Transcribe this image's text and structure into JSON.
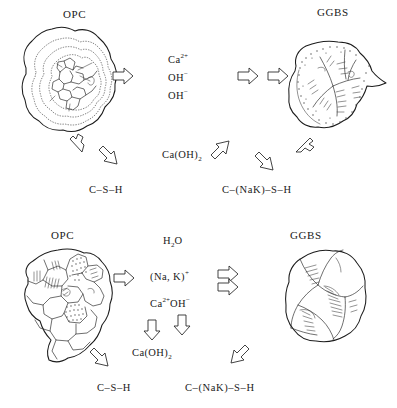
{
  "diagram": {
    "title_top_left": "OPC",
    "title_top_right": "GGBS",
    "title_bottom_left": "OPC",
    "title_bottom_right": "GGBS"
  },
  "top_panel": {
    "label_opc": "OPC",
    "label_ggbs": "GGBS",
    "species": [
      {
        "id": "calcium-ion",
        "base": "Ca",
        "sup": "2+"
      },
      {
        "id": "hydroxide-ion-1",
        "base": "OH",
        "sup": "−"
      },
      {
        "id": "hydroxide-ion-2",
        "base": "OH",
        "sup": "−"
      }
    ],
    "portlandite": {
      "base": "Ca(OH)",
      "sub": "2"
    },
    "product_left": "C–S–H",
    "product_right": "C–(NaK)–S–H"
  },
  "bottom_panel": {
    "label_opc": "OPC",
    "label_ggbs": "GGBS",
    "water": {
      "base": "H",
      "sub": "2",
      "tail": "O"
    },
    "alkali": {
      "base": "(Na, K)",
      "sup": "+"
    },
    "calcium_hydroxide_ions": {
      "base_ca": "Ca",
      "sup_ca": "2+",
      "base_oh": "OH",
      "sup_oh": "−"
    },
    "portlandite": {
      "base": "Ca(OH)",
      "sub": "2"
    },
    "product_left": "C–S–H",
    "product_right": "C–(NaK)–S–H"
  },
  "colors": {
    "ink": "#1c1c1c",
    "background": "#ffffff",
    "stipple": "#4a4a4a"
  }
}
